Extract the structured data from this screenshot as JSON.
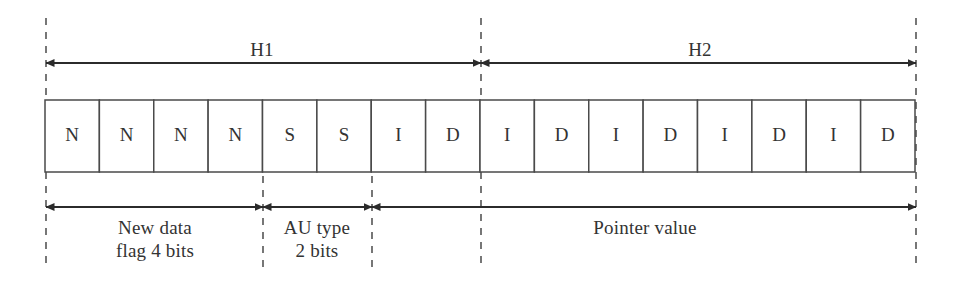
{
  "diagram": {
    "geometry": {
      "width": 954,
      "height": 282,
      "table_left": 45,
      "table_right": 915,
      "table_top": 100,
      "table_bottom": 172,
      "cell_count": 16,
      "top_arrow_y": 63,
      "bottom_arrow_y": 207,
      "guide_top": 18,
      "guide_bottom": 270
    },
    "colors": {
      "stroke": "#4a4a4a",
      "arrow": "#2b2b2b",
      "guide": "#555555",
      "text": "#333333",
      "background": "#ffffff"
    },
    "cells": [
      {
        "label": "N",
        "index": 1
      },
      {
        "label": "N",
        "index": 2
      },
      {
        "label": "N",
        "index": 3
      },
      {
        "label": "N",
        "index": 4
      },
      {
        "label": "S",
        "index": 5
      },
      {
        "label": "S",
        "index": 6
      },
      {
        "label": "I",
        "index": 7
      },
      {
        "label": "D",
        "index": 8
      },
      {
        "label": "I",
        "index": 9
      },
      {
        "label": "D",
        "index": 10
      },
      {
        "label": "I",
        "index": 11
      },
      {
        "label": "D",
        "index": 12
      },
      {
        "label": "I",
        "index": 13
      },
      {
        "label": "D",
        "index": 14
      },
      {
        "label": "I",
        "index": 15
      },
      {
        "label": "D",
        "index": 16
      }
    ],
    "top_spans": [
      {
        "name": "h1",
        "label": "H1",
        "start_cell": 0,
        "end_cell": 8,
        "x1": 46,
        "x2": 481,
        "label_x": 262,
        "label_y": 57
      },
      {
        "name": "h2",
        "label": "H2",
        "start_cell": 8,
        "end_cell": 16,
        "x1": 481,
        "x2": 916,
        "label_x": 700,
        "label_y": 57
      }
    ],
    "bottom_spans": [
      {
        "name": "new-data-flag",
        "label": "New data\nflag 4 bits",
        "start_cell": 0,
        "end_cell": 4,
        "x1": 46,
        "x2": 263,
        "label_x": 155,
        "label_y": 216
      },
      {
        "name": "au-type",
        "label": "AU type\n2 bits",
        "start_cell": 4,
        "end_cell": 6,
        "x1": 263,
        "x2": 372,
        "label_x": 317,
        "label_y": 216
      },
      {
        "name": "pointer-value",
        "label": "Pointer value",
        "start_cell": 6,
        "end_cell": 16,
        "x1": 372,
        "x2": 916,
        "label_x": 645,
        "label_y": 216
      }
    ],
    "guides": [
      {
        "name": "guide-left",
        "x": 46
      },
      {
        "name": "guide-h1-h2-boundary",
        "x": 481
      },
      {
        "name": "guide-right",
        "x": 916
      }
    ],
    "short_guides": [
      {
        "name": "guide-au-type-start",
        "x": 263,
        "y1": 176,
        "y2": 270
      },
      {
        "name": "guide-au-type-end",
        "x": 372,
        "y1": 176,
        "y2": 270
      }
    ]
  }
}
